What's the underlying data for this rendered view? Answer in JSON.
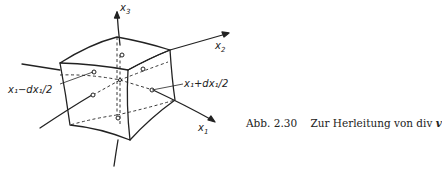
{
  "diagram": {
    "axes": [
      {
        "id": "x1",
        "label": "x",
        "subscript": "1"
      },
      {
        "id": "x2",
        "label": "x",
        "subscript": "2"
      },
      {
        "id": "x3",
        "label": "x",
        "subscript": "3"
      }
    ],
    "face_labels": {
      "left": "x₁−dx₁/2",
      "right": "x₁+dx₁/2"
    }
  },
  "caption": {
    "figure_number": "Abb. 2.30",
    "text": "Zur Herleitung von div",
    "vector_symbol": "v"
  }
}
